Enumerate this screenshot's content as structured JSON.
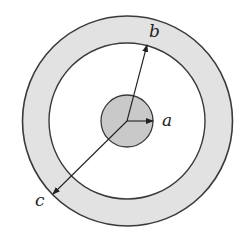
{
  "diagram": {
    "type": "concentric-circles",
    "center": [
      127,
      121
    ],
    "regions": [
      {
        "name": "inner-disc",
        "radius": 26,
        "fill": "#c9c9c9"
      },
      {
        "name": "gap",
        "inner_radius": 26,
        "outer_radius": 78,
        "fill": "#ffffff"
      },
      {
        "name": "outer-shell",
        "inner_radius": 78,
        "outer_radius": 105,
        "fill": "#e2e2e2"
      }
    ],
    "stroke_color": "#3a3a3a",
    "labels": {
      "a": "a",
      "b": "b",
      "c": "c"
    },
    "arrows": [
      {
        "label": "a",
        "to": [
          153,
          121
        ]
      },
      {
        "label": "b",
        "to": [
          147,
          45
        ]
      },
      {
        "label": "c",
        "to": [
          54,
          193
        ]
      }
    ]
  }
}
